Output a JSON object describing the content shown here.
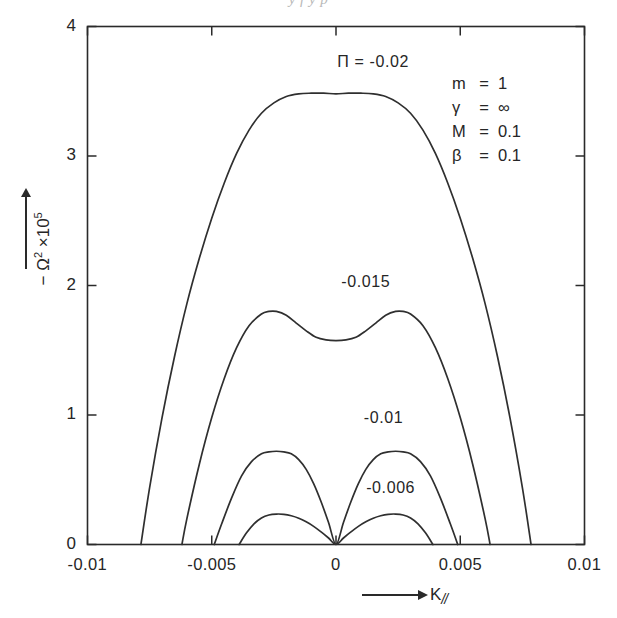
{
  "figure": {
    "clipped_header_text": "y  f  y            p",
    "background": "#ffffff",
    "ink_color": "#2f2f2f"
  },
  "legend": {
    "items": [
      {
        "symbol": "m",
        "eq": "=",
        "value": "1"
      },
      {
        "symbol": "γ",
        "eq": "=",
        "value": "∞"
      },
      {
        "symbol": "M",
        "eq": "=",
        "value": "0.1"
      },
      {
        "symbol": "β",
        "eq": "=",
        "value": "0.1"
      }
    ]
  },
  "axes": {
    "x_title_arrow": "⟶",
    "x_title": "K",
    "x_title_sub": "//",
    "y_title_prefix": "− Ω",
    "y_title_exp": "2",
    "y_title_mult": " ×10",
    "y_title_mult_exp": "5",
    "x_ticks": [
      "-0.01",
      "-0.005",
      "0",
      "0.005",
      "0.01"
    ],
    "y_ticks": [
      "0",
      "1",
      "2",
      "3",
      "4"
    ]
  },
  "curve_labels": [
    {
      "text": "Π = -0.02"
    },
    {
      "text": "-0.015"
    },
    {
      "text": "-0.01"
    },
    {
      "text": "-0.006"
    }
  ],
  "chart_data": {
    "type": "line",
    "title": "",
    "xlabel": "K//",
    "ylabel": "-Ω² ×10⁵",
    "xlim": [
      -0.01,
      0.01
    ],
    "ylim": [
      0,
      4
    ],
    "xticks": [
      -0.01,
      -0.005,
      0,
      0.005,
      0.01
    ],
    "yticks": [
      0,
      1,
      2,
      3,
      4
    ],
    "grid": false,
    "legend_position": "top-right-inside",
    "parameters": {
      "m": 1,
      "gamma": "infinity",
      "M": 0.1,
      "beta": 0.1
    },
    "series": [
      {
        "name": "Π = -0.02",
        "pi": -0.02,
        "label_position": {
          "x": 0.0015,
          "y": 3.72
        },
        "comment": "single broad dome, peak 3.48 at K=0, roots at ±0.00785",
        "x": [
          -0.00785,
          -0.0075,
          -0.007,
          -0.0065,
          -0.006,
          -0.0055,
          -0.005,
          -0.0045,
          -0.004,
          -0.0035,
          -0.003,
          -0.0025,
          -0.002,
          -0.0015,
          -0.001,
          -0.0005,
          0,
          0.0005,
          0.001,
          0.0015,
          0.002,
          0.0025,
          0.003,
          0.0035,
          0.004,
          0.0045,
          0.005,
          0.0055,
          0.006,
          0.0065,
          0.007,
          0.0075,
          0.00785
        ],
        "y": [
          0,
          0.44,
          0.98,
          1.45,
          1.86,
          2.21,
          2.52,
          2.79,
          3.02,
          3.2,
          3.33,
          3.41,
          3.46,
          3.48,
          3.485,
          3.485,
          3.48,
          3.485,
          3.485,
          3.48,
          3.46,
          3.41,
          3.33,
          3.2,
          3.02,
          2.79,
          2.52,
          2.21,
          1.86,
          1.45,
          0.98,
          0.44,
          0
        ]
      },
      {
        "name": "-0.015",
        "pi": -0.015,
        "label_position": {
          "x": 0.0012,
          "y": 2.02
        },
        "comment": "twin humps 1.80 at K=±0.0024, central dip to 1.58, roots ±0.0062",
        "x": [
          -0.0062,
          -0.006,
          -0.0055,
          -0.005,
          -0.0045,
          -0.004,
          -0.0035,
          -0.003,
          -0.0027,
          -0.0024,
          -0.002,
          -0.0016,
          -0.0012,
          -0.0008,
          -0.0004,
          0,
          0.0004,
          0.0008,
          0.0012,
          0.0016,
          0.002,
          0.0024,
          0.0027,
          0.003,
          0.0035,
          0.004,
          0.0045,
          0.005,
          0.0055,
          0.006,
          0.0062
        ],
        "y": [
          0,
          0.2,
          0.62,
          0.98,
          1.28,
          1.52,
          1.69,
          1.78,
          1.8,
          1.8,
          1.77,
          1.71,
          1.65,
          1.6,
          1.58,
          1.575,
          1.58,
          1.6,
          1.65,
          1.71,
          1.77,
          1.8,
          1.8,
          1.78,
          1.69,
          1.52,
          1.28,
          0.98,
          0.62,
          0.2,
          0
        ]
      },
      {
        "name": "-0.01",
        "pi": -0.01,
        "label_position": {
          "x": 0.0019,
          "y": 0.97
        },
        "comment": "two separate lobes pinching to 0 at K=0, peaks 0.72 at ±0.0024, outer roots ±0.0049",
        "x": [
          -0.0049,
          -0.0046,
          -0.0042,
          -0.0038,
          -0.0034,
          -0.003,
          -0.0027,
          -0.0024,
          -0.0021,
          -0.0018,
          -0.0015,
          -0.0012,
          -0.0009,
          -0.0006,
          -0.0003,
          0,
          0.0003,
          0.0006,
          0.0009,
          0.0012,
          0.0015,
          0.0018,
          0.0021,
          0.0024,
          0.0027,
          0.003,
          0.0034,
          0.0038,
          0.0042,
          0.0046,
          0.0049
        ],
        "y": [
          0,
          0.16,
          0.36,
          0.53,
          0.64,
          0.7,
          0.715,
          0.72,
          0.715,
          0.7,
          0.655,
          0.58,
          0.47,
          0.33,
          0.17,
          0,
          0.17,
          0.33,
          0.47,
          0.58,
          0.655,
          0.7,
          0.715,
          0.72,
          0.715,
          0.7,
          0.64,
          0.53,
          0.36,
          0.16,
          0
        ]
      },
      {
        "name": "-0.006",
        "pi": -0.006,
        "label_position": {
          "x": 0.0022,
          "y": 0.43
        },
        "comment": "two small lobes pinching to 0 at K=0, peaks 0.235 at ±0.0023, outer roots ±0.0039",
        "x": [
          -0.0039,
          -0.0036,
          -0.0033,
          -0.003,
          -0.0027,
          -0.0024,
          -0.0021,
          -0.0018,
          -0.0015,
          -0.0012,
          -0.0009,
          -0.0006,
          -0.0003,
          0,
          0.0003,
          0.0006,
          0.0009,
          0.0012,
          0.0015,
          0.0018,
          0.0021,
          0.0024,
          0.0027,
          0.003,
          0.0033,
          0.0036,
          0.0039
        ],
        "y": [
          0,
          0.09,
          0.16,
          0.205,
          0.228,
          0.235,
          0.233,
          0.222,
          0.203,
          0.175,
          0.14,
          0.097,
          0.05,
          0,
          0.05,
          0.097,
          0.14,
          0.175,
          0.203,
          0.222,
          0.233,
          0.235,
          0.228,
          0.205,
          0.16,
          0.09,
          0
        ]
      }
    ]
  }
}
